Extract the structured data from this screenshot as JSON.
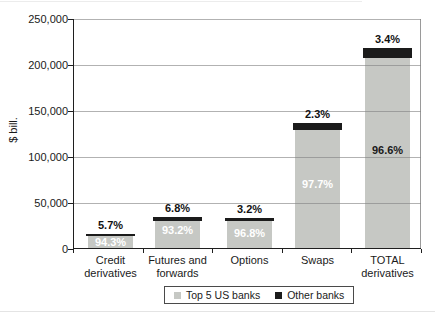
{
  "chart_data": {
    "type": "bar",
    "stacked": true,
    "ylabel": "$ bill.",
    "ylim": [
      0,
      250000
    ],
    "ytick_labels": [
      "0",
      "50,000",
      "100,000",
      "150,000",
      "200,000",
      "250,000"
    ],
    "grid": true,
    "legend_position": "bottom",
    "categories": [
      "Credit derivatives",
      "Futures and forwards",
      "Options",
      "Swaps",
      "TOTAL derivatives"
    ],
    "category_label_lines": [
      [
        "Credit",
        "derivatives"
      ],
      [
        "Futures and",
        "forwards"
      ],
      [
        "Options"
      ],
      [
        "Swaps"
      ],
      [
        "TOTAL",
        "derivatives"
      ]
    ],
    "totals": [
      16000,
      35000,
      34000,
      137000,
      218000
    ],
    "series": [
      {
        "name": "Top 5 US banks",
        "color": "#c6c8c4",
        "percents": [
          94.3,
          93.2,
          96.8,
          97.7,
          96.6
        ],
        "percent_labels": [
          "94.3%",
          "93.2%",
          "96.8%",
          "97.7%",
          "96.6%"
        ]
      },
      {
        "name": "Other banks",
        "color": "#1b1b1b",
        "percents": [
          5.7,
          6.8,
          3.2,
          2.3,
          3.4
        ],
        "percent_labels": [
          "5.7%",
          "6.8%",
          "3.2%",
          "2.3%",
          "3.4%"
        ]
      }
    ]
  }
}
